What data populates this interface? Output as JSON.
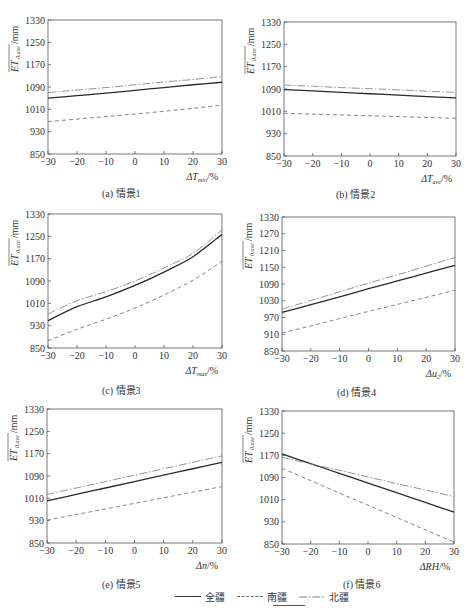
{
  "legend": {
    "items": [
      {
        "label": "全疆",
        "style": "solid"
      },
      {
        "label": "南疆",
        "style": "dashed"
      },
      {
        "label": "北疆",
        "style": "dashdot"
      }
    ]
  },
  "panels": [
    {
      "id": "a",
      "caption": "(a)  情景1",
      "xlabel": "ΔTmin/%",
      "xsub": "min",
      "xvar": "ΔT",
      "ylabel": "ET0,ave/mm"
    },
    {
      "id": "b",
      "caption": "(b)  情景2",
      "xlabel": "ΔTave/%",
      "xsub": "ave",
      "xvar": "ΔT",
      "ylabel": "ET0,ave/mm"
    },
    {
      "id": "c",
      "caption": "(c)  情景3",
      "xlabel": "ΔTmax/%",
      "xsub": "max",
      "xvar": "ΔT",
      "ylabel": "ET0,ave/mm"
    },
    {
      "id": "d",
      "caption": "(d)  情景4",
      "xlabel": "Δu2/%",
      "xsub": "2",
      "xvar": "Δu",
      "ylabel": "ET0,ave/mm"
    },
    {
      "id": "e",
      "caption": "(e)  情景5",
      "xlabel": "Δn/%",
      "xsub": "",
      "xvar": "Δn",
      "ylabel": "ET0,ave/mm"
    },
    {
      "id": "f",
      "caption": "(f)  情景6",
      "xlabel": "ΔRH/%",
      "xsub": "",
      "xvar": "ΔRH",
      "ylabel": "ET0,ave/mm"
    }
  ],
  "chart_data": [
    {
      "type": "line",
      "title": "(a) 情景1",
      "xlabel": "ΔTmin/%",
      "ylabel": "ET0,ave/mm",
      "x": [
        -30,
        -20,
        -10,
        0,
        10,
        20,
        30
      ],
      "xlim": [
        -30,
        30
      ],
      "ylim": [
        850,
        1330
      ],
      "yticks": [
        850,
        930,
        1010,
        1090,
        1170,
        1250,
        1330
      ],
      "grid": false,
      "series": [
        {
          "name": "全疆",
          "values": [
            1050,
            1059,
            1068,
            1078,
            1088,
            1098,
            1107
          ]
        },
        {
          "name": "南疆",
          "values": [
            966,
            975,
            984,
            993,
            1003,
            1014,
            1025
          ]
        },
        {
          "name": "北疆",
          "values": [
            1070,
            1079,
            1088,
            1098,
            1108,
            1117,
            1127
          ]
        }
      ]
    },
    {
      "type": "line",
      "title": "(b) 情景2",
      "xlabel": "ΔTave/%",
      "ylabel": "ET0,ave/mm",
      "x": [
        -30,
        -20,
        -10,
        0,
        10,
        20,
        30
      ],
      "xlim": [
        -30,
        30
      ],
      "ylim": [
        850,
        1330
      ],
      "yticks": [
        850,
        930,
        1010,
        1090,
        1170,
        1250,
        1330
      ],
      "grid": false,
      "series": [
        {
          "name": "全疆",
          "values": [
            1088,
            1083,
            1078,
            1073,
            1068,
            1063,
            1058
          ]
        },
        {
          "name": "南疆",
          "values": [
            1003,
            1000,
            997,
            994,
            991,
            988,
            985
          ]
        },
        {
          "name": "北疆",
          "values": [
            1104,
            1100,
            1095,
            1091,
            1087,
            1082,
            1078
          ]
        }
      ]
    },
    {
      "type": "line",
      "title": "(c) 情景3",
      "xlabel": "ΔTmax/%",
      "ylabel": "ET0,ave/mm",
      "x": [
        -30,
        -20,
        -10,
        0,
        10,
        20,
        30
      ],
      "xlim": [
        -30,
        30
      ],
      "ylim": [
        850,
        1330
      ],
      "yticks": [
        850,
        930,
        1010,
        1090,
        1170,
        1250,
        1330
      ],
      "grid": false,
      "series": [
        {
          "name": "全疆",
          "values": [
            948,
            998,
            1033,
            1074,
            1122,
            1177,
            1257
          ]
        },
        {
          "name": "南疆",
          "values": [
            876,
            917,
            953,
            993,
            1040,
            1093,
            1160
          ]
        },
        {
          "name": "北疆",
          "values": [
            972,
            1019,
            1052,
            1090,
            1137,
            1189,
            1273
          ]
        }
      ]
    },
    {
      "type": "line",
      "title": "(d) 情景4",
      "xlabel": "Δu2/%",
      "ylabel": "ET0,ave/mm",
      "x": [
        -30,
        -20,
        -10,
        0,
        10,
        20,
        30
      ],
      "xlim": [
        -30,
        30
      ],
      "ylim": [
        850,
        1330
      ],
      "yticks": [
        850,
        910,
        970,
        1030,
        1090,
        1150,
        1210,
        1270,
        1330
      ],
      "grid": false,
      "series": [
        {
          "name": "全疆",
          "values": [
            988,
            1016,
            1044,
            1073,
            1101,
            1129,
            1157
          ]
        },
        {
          "name": "南疆",
          "values": [
            915,
            940,
            966,
            992,
            1017,
            1042,
            1068
          ]
        },
        {
          "name": "北疆",
          "values": [
            1000,
            1031,
            1062,
            1093,
            1123,
            1154,
            1185
          ]
        }
      ]
    },
    {
      "type": "line",
      "title": "(e) 情景5",
      "xlabel": "Δn/%",
      "ylabel": "ET0,ave/mm",
      "x": [
        -30,
        -20,
        -10,
        0,
        10,
        20,
        30
      ],
      "xlim": [
        -30,
        30
      ],
      "ylim": [
        850,
        1330
      ],
      "yticks": [
        850,
        930,
        1010,
        1090,
        1170,
        1250,
        1330
      ],
      "grid": false,
      "series": [
        {
          "name": "全疆",
          "values": [
            1001,
            1024,
            1047,
            1070,
            1093,
            1116,
            1139
          ]
        },
        {
          "name": "南疆",
          "values": [
            932,
            952,
            972,
            992,
            1012,
            1032,
            1052
          ]
        },
        {
          "name": "北疆",
          "values": [
            1024,
            1047,
            1070,
            1093,
            1116,
            1139,
            1162
          ]
        }
      ]
    },
    {
      "type": "line",
      "title": "(f) 情景6",
      "xlabel": "ΔRH/%",
      "ylabel": "ET0,ave/mm",
      "x": [
        -30,
        -20,
        -10,
        0,
        10,
        20,
        30
      ],
      "xlim": [
        -30,
        30
      ],
      "ylim": [
        850,
        1330
      ],
      "yticks": [
        850,
        930,
        1010,
        1090,
        1170,
        1250,
        1330
      ],
      "grid": false,
      "series": [
        {
          "name": "全疆",
          "values": [
            1175,
            1140,
            1105,
            1070,
            1035,
            1000,
            965
          ]
        },
        {
          "name": "南疆",
          "values": [
            1123,
            1079,
            1034,
            990,
            946,
            901,
            857
          ]
        },
        {
          "name": "北疆",
          "values": [
            1163,
            1139,
            1116,
            1092,
            1068,
            1045,
            1021
          ]
        }
      ]
    }
  ]
}
